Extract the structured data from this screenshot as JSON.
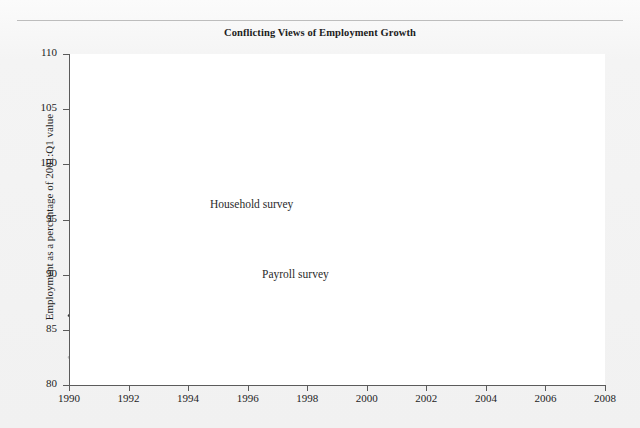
{
  "figure": {
    "title": "Conflicting Views of Employment Growth",
    "ylabel": "Employment as a percentage of 2001:Q1 value",
    "series_labels": {
      "household": "Household survey",
      "payroll": "Payroll survey"
    }
  },
  "colors": {
    "household": "#3a3a3a",
    "payroll": "#b9b9b9",
    "axis": "#5b5b5b",
    "plot_background": "#ffffff",
    "page_background": "#f2f2f2",
    "text": "#1d1d1d"
  },
  "chart_data": {
    "type": "line",
    "title": "Conflicting Views of Employment Growth",
    "xlabel": "",
    "ylabel": "Employment as a percentage of 2001:Q1 value",
    "xlim": [
      1990,
      2008
    ],
    "ylim": [
      80,
      110
    ],
    "xticks": [
      1990,
      1992,
      1994,
      1996,
      1998,
      2000,
      2002,
      2004,
      2006,
      2008
    ],
    "yticks": [
      80,
      85,
      90,
      95,
      100,
      105,
      110
    ],
    "grid": false,
    "legend": "inline-annotations",
    "x": [
      1990.0,
      1990.5,
      1991.0,
      1991.5,
      1992.0,
      1992.5,
      1993.0,
      1993.5,
      1994.0,
      1994.5,
      1994.75,
      1995.0,
      1995.5,
      1996.0,
      1996.5,
      1997.0,
      1997.5,
      1998.0,
      1998.5,
      1999.0,
      1999.5,
      2000.0,
      2000.25,
      2000.5,
      2000.75,
      2001.0,
      2001.25,
      2001.5,
      2001.75,
      2002.0,
      2002.25,
      2002.5,
      2002.75,
      2003.0,
      2003.25,
      2003.5,
      2003.75,
      2004.0,
      2004.5,
      2005.0,
      2005.5,
      2006.0,
      2006.5,
      2007.0,
      2007.25,
      2007.5,
      2007.8
    ],
    "series": [
      {
        "name": "Household survey",
        "color": "#3a3a3a",
        "values": [
          86.3,
          86.0,
          85.4,
          85.4,
          85.4,
          85.6,
          86.2,
          86.9,
          87.8,
          88.6,
          90.3,
          90.2,
          90.4,
          91.0,
          91.8,
          92.6,
          93.4,
          94.2,
          94.9,
          95.8,
          96.6,
          97.6,
          98.2,
          98.9,
          98.6,
          99.4,
          100.1,
          99.7,
          99.1,
          98.8,
          99.2,
          99.0,
          99.5,
          99.7,
          99.6,
          100.2,
          100.4,
          100.4,
          101.2,
          101.9,
          102.8,
          103.7,
          104.6,
          105.6,
          106.0,
          106.2,
          106.4
        ]
      },
      {
        "name": "Payroll survey",
        "color": "#b9b9b9",
        "values": [
          82.5,
          82.6,
          81.9,
          81.6,
          81.6,
          81.7,
          82.2,
          82.9,
          83.9,
          85.0,
          85.6,
          86.3,
          87.6,
          88.8,
          90.0,
          91.2,
          92.4,
          93.6,
          94.6,
          95.6,
          96.5,
          97.6,
          98.3,
          99.1,
          99.0,
          99.6,
          100.1,
          99.4,
          98.8,
          98.5,
          98.5,
          98.4,
          98.3,
          98.2,
          98.1,
          98.2,
          98.5,
          98.8,
          99.4,
          100.1,
          100.9,
          101.7,
          102.5,
          103.3,
          103.7,
          104.0,
          104.4
        ]
      }
    ]
  }
}
